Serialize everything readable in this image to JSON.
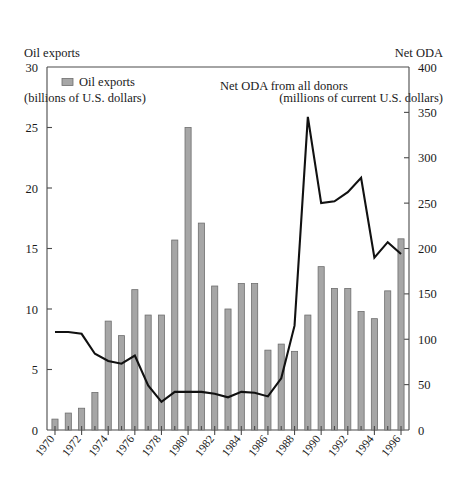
{
  "header": {
    "left_line1": "Oil exports",
    "left_line2": "(billions of U.S. dollars)",
    "right_line1": "Net ODA",
    "right_line2": "(millions of current U.S. dollars)"
  },
  "legend": {
    "items": [
      {
        "label": "Oil exports",
        "swatch": "bar-swatch-icon",
        "color": "#a6a6a6"
      }
    ]
  },
  "annotations": [
    {
      "text": "Net ODA from all donors",
      "x_year": 1987.2,
      "y_value": 375
    }
  ],
  "chart_data": {
    "type": "bar",
    "title": "",
    "subtitle": "",
    "xlabel": "",
    "ylabel": "Oil exports (billions of U.S. dollars)",
    "y2label": "Net ODA (millions of current U.S. dollars)",
    "grid": false,
    "legend_position": "top-left",
    "categories": [
      1970,
      1971,
      1972,
      1973,
      1974,
      1975,
      1976,
      1977,
      1978,
      1979,
      1980,
      1981,
      1982,
      1983,
      1984,
      1985,
      1986,
      1987,
      1988,
      1989,
      1990,
      1991,
      1992,
      1993,
      1994,
      1995,
      1996
    ],
    "xlim": [
      1969.4,
      1996.6
    ],
    "xticks": [
      1970,
      1972,
      1974,
      1976,
      1978,
      1980,
      1982,
      1984,
      1986,
      1988,
      1990,
      1992,
      1994,
      1996
    ],
    "xticklabels": [
      "1970",
      "1972",
      "1974",
      "1976",
      "1978",
      "1980",
      "1982",
      "1984",
      "1986",
      "1988",
      "1990",
      "1992",
      "1994",
      "1996"
    ],
    "ylim": [
      0,
      30
    ],
    "yticks": [
      0,
      5,
      10,
      15,
      20,
      25,
      30
    ],
    "yticklabels": [
      "0",
      "5",
      "10",
      "15",
      "20",
      "25",
      "30"
    ],
    "y2lim": [
      0,
      400
    ],
    "y2ticks": [
      0,
      50,
      100,
      150,
      200,
      250,
      300,
      350,
      400
    ],
    "y2ticklabels": [
      "0",
      "50",
      "100",
      "150",
      "200",
      "250",
      "300",
      "350",
      "400"
    ],
    "series": [
      {
        "name": "Oil exports",
        "type": "bar",
        "axis": "left",
        "units": "billions of U.S. dollars",
        "color": "#a6a6a6",
        "values": [
          0.9,
          1.4,
          1.8,
          3.1,
          9.0,
          7.8,
          11.6,
          9.5,
          9.5,
          15.7,
          25.0,
          17.1,
          11.9,
          10.0,
          12.1,
          12.1,
          6.6,
          7.1,
          6.5,
          9.5,
          13.5,
          11.7,
          11.7,
          9.8,
          9.2,
          11.5,
          15.8
        ]
      },
      {
        "name": "Net ODA from all donors",
        "type": "line",
        "axis": "right",
        "units": "millions of current U.S. dollars",
        "color": "#111111",
        "values": [
          108,
          108,
          106,
          84,
          76,
          73,
          82,
          49,
          31,
          42,
          42,
          42,
          40,
          36,
          42,
          41,
          37,
          57,
          115,
          345,
          250,
          252,
          262,
          278,
          190,
          207,
          194
        ]
      }
    ]
  }
}
